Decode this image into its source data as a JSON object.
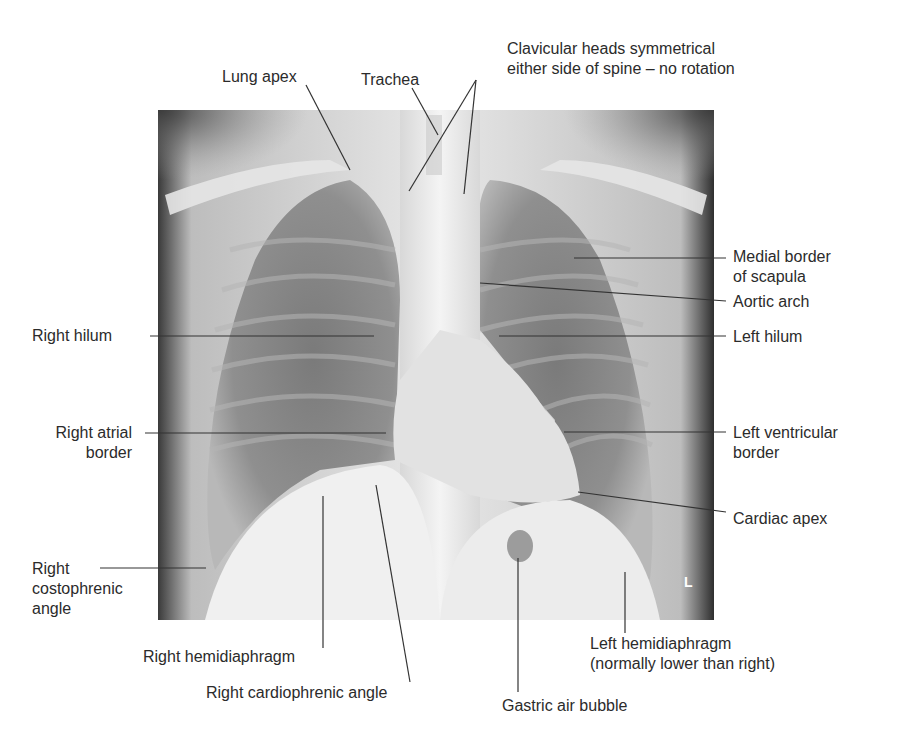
{
  "figure": {
    "side_marker": "L",
    "labels": {
      "lung_apex": "Lung apex",
      "trachea": "Trachea",
      "clavicular_1": "Clavicular heads symmetrical",
      "clavicular_2": "either side of spine – no rotation",
      "medial_scapula_1": "Medial border",
      "medial_scapula_2": "of scapula",
      "aortic_arch": "Aortic arch",
      "right_hilum": "Right hilum",
      "left_hilum": "Left hilum",
      "right_atrial_1": "Right atrial",
      "right_atrial_2": "border",
      "left_ventricular_1": "Left ventricular",
      "left_ventricular_2": "border",
      "cardiac_apex": "Cardiac apex",
      "right_costophrenic_1": "Right",
      "right_costophrenic_2": "costophrenic",
      "right_costophrenic_3": "angle",
      "right_hemidiaphragm": "Right hemidiaphragm",
      "right_cardiophrenic": "Right cardiophrenic angle",
      "gastric_air_bubble": "Gastric air bubble",
      "left_hemidiaphragm_1": "Left hemidiaphragm",
      "left_hemidiaphragm_2": "(normally lower than right)"
    }
  }
}
